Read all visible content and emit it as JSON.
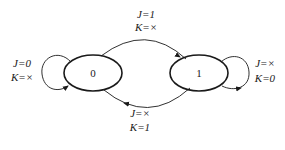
{
  "diagram": {
    "type": "state-transition",
    "states": [
      {
        "id": "s0",
        "label": "0"
      },
      {
        "id": "s1",
        "label": "1"
      }
    ],
    "transitions": [
      {
        "from": "0",
        "to": "1",
        "label_line1": "J=1",
        "label_line2": "K=×"
      },
      {
        "from": "1",
        "to": "0",
        "label_line1": "J=×",
        "label_line2": "K=1"
      },
      {
        "from": "0",
        "to": "0",
        "label_line1": "J=0",
        "label_line2": "K=×"
      },
      {
        "from": "1",
        "to": "1",
        "label_line1": "J=×",
        "label_line2": "K=0"
      }
    ]
  }
}
